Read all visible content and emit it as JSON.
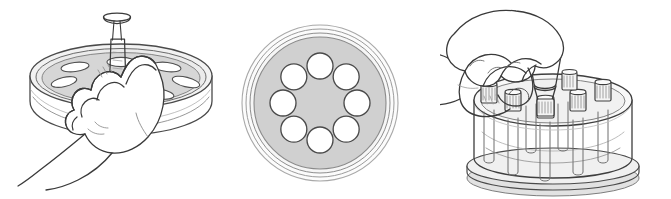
{
  "figure": {
    "background_color": "#ffffff",
    "width": 671,
    "height": 199,
    "panel_count": 3,
    "style": "black-and-white technical line drawing"
  },
  "palette": {
    "background": "#ffffff",
    "outline": "#3a3a3a",
    "outline_light": "#8e8e8e",
    "hatch": "#9a9a9a",
    "dish_fill": "#d0d0d0",
    "dish_fill_dark": "#c2c2c2",
    "dish_rim": "#e8e8e8",
    "well_fill": "#ffffff",
    "glass_fill": "#efefef",
    "glass_fill_light": "#f7f7f7",
    "skin_fill": "#ffffff",
    "shadow": "#dcdcdc"
  },
  "panels": [
    {
      "id": "panel-left",
      "name": "hand-with-syringe-over-dish",
      "caption": "",
      "objects": [
        {
          "name": "petri-dish-angled",
          "type": "multiwell-dish",
          "wells_visible": 6
        },
        {
          "name": "hand-holding-syringe",
          "type": "hand",
          "orientation": "left-hand-palm-down"
        },
        {
          "name": "syringe",
          "type": "syringe",
          "parts": [
            "plunger-top",
            "barrel",
            "needle"
          ]
        }
      ]
    },
    {
      "id": "panel-middle",
      "name": "multiwell-dish-top-view",
      "caption": "",
      "dish": {
        "center_x": 90,
        "center_y": 103,
        "outer_radius": 78,
        "rim_radii": [
          78,
          74,
          70
        ],
        "plate_radius": 66,
        "well_ring_radius": 37,
        "well_radius": 13,
        "well_count": 8,
        "well_start_angle_deg": -90,
        "fill": "#d0d0d0",
        "well_fill": "#ffffff"
      },
      "objects": [
        {
          "name": "petri-dish-top-view",
          "type": "multiwell-dish",
          "wells_visible": 8
        }
      ]
    },
    {
      "id": "panel-right",
      "name": "hand-placing-tube-in-rack",
      "caption": "",
      "objects": [
        {
          "name": "tube-rack",
          "type": "circular-rack",
          "tubes_visible": 8
        },
        {
          "name": "hand-holding-tube",
          "type": "hand",
          "orientation": "right-hand-pinch-grip"
        },
        {
          "name": "capped-tube",
          "type": "specimen-tube",
          "parts": [
            "ribbed-cap",
            "body"
          ]
        }
      ]
    }
  ]
}
